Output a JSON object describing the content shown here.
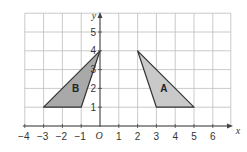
{
  "diagram": {
    "type": "coordinate-grid",
    "x_range": [
      -4,
      6
    ],
    "y_range": [
      0,
      6
    ],
    "x_axis_label": "x",
    "y_axis_label": "y",
    "origin_label": "O",
    "x_tick_labels": [
      "−4",
      "−3",
      "−2",
      "−1",
      "1",
      "2",
      "3",
      "4",
      "5",
      "6"
    ],
    "x_tick_values": [
      -4,
      -3,
      -2,
      -1,
      1,
      2,
      3,
      4,
      5,
      6
    ],
    "y_tick_labels": [
      "1",
      "2",
      "3",
      "4",
      "5"
    ],
    "y_tick_values": [
      1,
      2,
      3,
      4,
      5
    ],
    "colors": {
      "grid": "#bdbdbd",
      "axis": "#444444",
      "outline": "#333333",
      "fill_A": "#c9c9c9",
      "fill_B": "#a9a9a9"
    },
    "shapes": [
      {
        "name": "A",
        "label": "A",
        "vertices": [
          [
            2,
            4
          ],
          [
            3,
            1
          ],
          [
            5,
            1
          ]
        ],
        "label_pos": [
          3.4,
          2.0
        ]
      },
      {
        "name": "B",
        "label": "B",
        "vertices": [
          [
            0,
            4
          ],
          [
            -3,
            1
          ],
          [
            -1,
            1
          ]
        ],
        "label_pos": [
          -1.3,
          2.0
        ]
      }
    ]
  }
}
